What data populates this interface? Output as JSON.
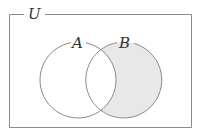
{
  "diagram": {
    "type": "venn",
    "universe_label": "U",
    "sets": [
      {
        "label": "A",
        "shaded": false
      },
      {
        "label": "B",
        "shaded": true,
        "shaded_region": "B minus A (B \\ A)"
      }
    ],
    "colors": {
      "stroke": "#8a8a8a",
      "shade": "#e8e8e8",
      "background": "#ffffff"
    }
  }
}
